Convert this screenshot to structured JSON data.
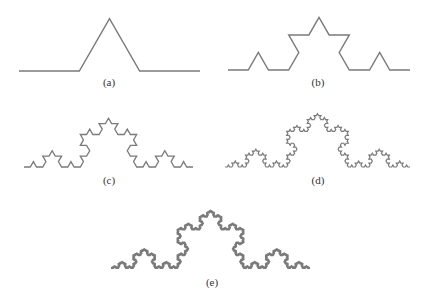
{
  "figure": {
    "stroke_color": "#7a7a7a",
    "panels": [
      {
        "id": "a",
        "label": "(a)",
        "iterations": 1,
        "x0": 19,
        "x1": 200,
        "y": 71,
        "label_x": 109,
        "label_y": 76,
        "stroke_width": 1.4
      },
      {
        "id": "b",
        "label": "(b)",
        "iterations": 2,
        "x0": 228,
        "x1": 410,
        "y": 70,
        "label_x": 318,
        "label_y": 76,
        "stroke_width": 1.4
      },
      {
        "id": "c",
        "label": "(c)",
        "iterations": 3,
        "x0": 24,
        "x1": 193,
        "y": 167,
        "label_x": 109,
        "label_y": 174,
        "stroke_width": 1.3
      },
      {
        "id": "d",
        "label": "(d)",
        "iterations": 4,
        "x0": 225,
        "x1": 410,
        "y": 167,
        "label_x": 318,
        "label_y": 174,
        "stroke_width": 1.2
      },
      {
        "id": "e",
        "label": "(e)",
        "iterations": 5,
        "x0": 111,
        "x1": 310,
        "y": 268,
        "label_x": 212,
        "label_y": 276,
        "stroke_width": 1.8
      }
    ]
  }
}
